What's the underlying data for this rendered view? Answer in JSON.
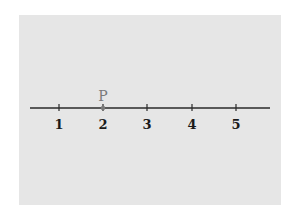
{
  "diagram": {
    "type": "number-line",
    "background_color": "#ffffff",
    "panel_color": "#e6e6e6",
    "line_color": "#2a2a2a",
    "point_color": "#7a7a7a",
    "line": {
      "x_start": 30,
      "x_end": 270,
      "y": 108
    },
    "ticks": [
      {
        "value": 1,
        "label": "1",
        "x": 59
      },
      {
        "value": 2,
        "label": "2",
        "x": 103
      },
      {
        "value": 3,
        "label": "3",
        "x": 147
      },
      {
        "value": 4,
        "label": "4",
        "x": 192
      },
      {
        "value": 5,
        "label": "5",
        "x": 236
      }
    ],
    "point": {
      "label": "P",
      "value": 2,
      "x": 103
    }
  }
}
